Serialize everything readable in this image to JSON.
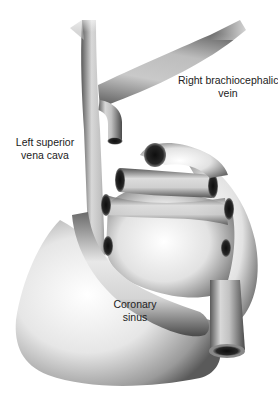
{
  "diagram": {
    "labels": {
      "right_brachiocephalic": {
        "line1": "Right brachiocephalic",
        "line2": "vein"
      },
      "left_svc": {
        "line1": "Left superior",
        "line2": "vena cava"
      },
      "coronary_sinus": {
        "line1": "Coronary",
        "line2": "sinus"
      }
    },
    "colors": {
      "background": "#ffffff",
      "vessel_light": "#f4f4f4",
      "vessel_mid": "#b8b8b8",
      "vessel_dark": "#3a3a3a",
      "lumen": "#1a1a1a",
      "label_text": "#222222"
    }
  }
}
